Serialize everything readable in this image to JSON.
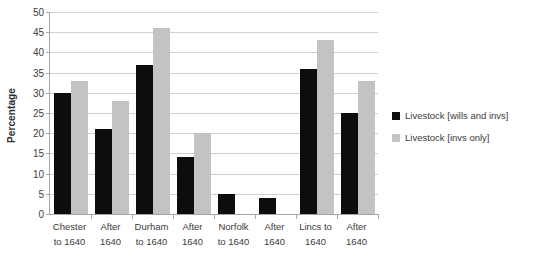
{
  "chart_data": {
    "type": "bar",
    "title": "",
    "xlabel": "",
    "ylabel": "Percentage",
    "ylim": [
      0,
      50
    ],
    "ytick_step": 5,
    "yticks": [
      50,
      45,
      40,
      35,
      30,
      25,
      20,
      15,
      10,
      5,
      0
    ],
    "grid": true,
    "legend_position": "right",
    "categories": [
      {
        "line1": "Chester",
        "line2": "to 1640"
      },
      {
        "line1": "After",
        "line2": "1640"
      },
      {
        "line1": "Durham",
        "line2": "to 1640"
      },
      {
        "line1": "After",
        "line2": "1640"
      },
      {
        "line1": "Norfolk",
        "line2": "to 1640"
      },
      {
        "line1": "After",
        "line2": "1640"
      },
      {
        "line1": "Lincs to",
        "line2": "1640"
      },
      {
        "line1": "After",
        "line2": "1640"
      }
    ],
    "series": [
      {
        "name": "Livestock [wills and invs]",
        "color": "#0d0d0d",
        "values": [
          30,
          21,
          37,
          14,
          5,
          4,
          36,
          25
        ]
      },
      {
        "name": "Livestock [invs only]",
        "color": "#c3c3c3",
        "values": [
          33,
          28,
          46,
          20,
          0,
          0,
          43,
          33
        ]
      }
    ]
  }
}
